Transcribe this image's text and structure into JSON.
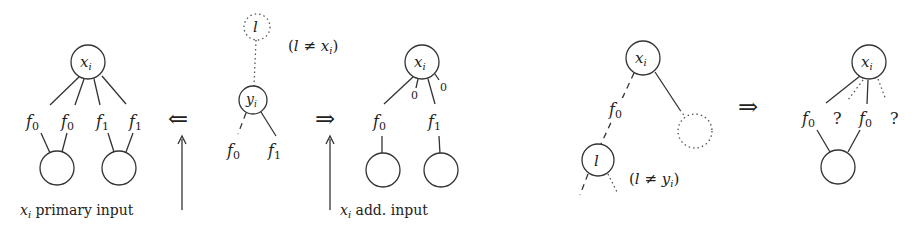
{
  "panel1": {
    "root": {
      "var": "x",
      "sub": "i"
    },
    "labels": [
      {
        "f": "f",
        "sub": "0"
      },
      {
        "f": "f",
        "sub": "0"
      },
      {
        "f": "f",
        "sub": "1"
      },
      {
        "f": "f",
        "sub": "1"
      }
    ],
    "arrow": "⇐",
    "caption": {
      "var": "x",
      "sub": "i",
      "text": " primary input"
    }
  },
  "center": {
    "top_node": "l",
    "condition": {
      "open": "(",
      "l": "l",
      "neq": " ≠ ",
      "var": "x",
      "sub": "i",
      "close": ")"
    },
    "node": {
      "var": "y",
      "sub": "i"
    },
    "labels": [
      {
        "f": "f",
        "sub": "0"
      },
      {
        "f": "f",
        "sub": "1"
      }
    ]
  },
  "panel2": {
    "arrow": "⇒",
    "root": {
      "var": "x",
      "sub": "i"
    },
    "zero_labels": [
      "0",
      "0"
    ],
    "labels": [
      {
        "f": "f",
        "sub": "0"
      },
      {
        "f": "f",
        "sub": "1"
      }
    ],
    "caption": {
      "var": "x",
      "sub": "i",
      "text": " add. input"
    }
  },
  "panel3": {
    "root": {
      "var": "x",
      "sub": "i"
    },
    "edge_label": {
      "f": "f",
      "sub": "0"
    },
    "child": "l",
    "condition": {
      "open": "(",
      "l": "l",
      "neq": " ≠ ",
      "var": "y",
      "sub": "i",
      "close": ")"
    },
    "arrow": "⇒"
  },
  "panel4": {
    "root": {
      "var": "x",
      "sub": "i"
    },
    "labels": [
      {
        "f": "f",
        "sub": "0"
      },
      {
        "q": "?"
      },
      {
        "f": "f",
        "sub": "0"
      },
      {
        "q": "?"
      }
    ]
  }
}
